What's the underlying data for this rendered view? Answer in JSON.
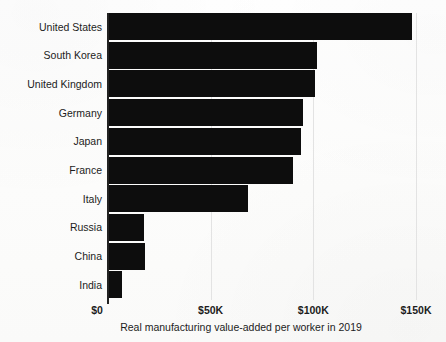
{
  "chart_data": {
    "type": "bar",
    "orientation": "horizontal",
    "title": "",
    "xlabel": "Real manufacturing value-added per worker in 2019",
    "ylabel": "",
    "categories": [
      "United States",
      "South Korea",
      "United Kingdom",
      "Germany",
      "Japan",
      "France",
      "Italy",
      "Russia",
      "China",
      "India"
    ],
    "values": [
      148000,
      102000,
      101000,
      95000,
      94000,
      90000,
      68000,
      17500,
      18000,
      7000
    ],
    "xlim": [
      0,
      150000
    ],
    "xticks": [
      0,
      50000,
      100000,
      150000
    ],
    "xtick_labels": [
      "$0",
      "$50K",
      "$100K",
      "$150K"
    ],
    "grid": true,
    "legend": false,
    "bar_color": "#0d0d0d",
    "gridline_color": "#e3e3e3",
    "axis_color": "#222222",
    "background_color": "#fdfdfc"
  }
}
